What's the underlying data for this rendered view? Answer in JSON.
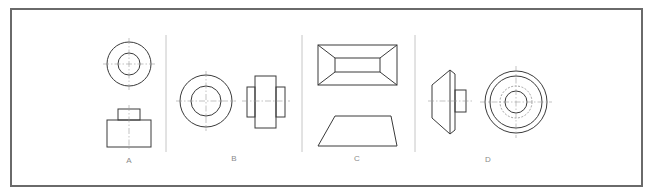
{
  "figure": {
    "panels": [
      {
        "id": "A",
        "label": "A",
        "description": "Top view (concentric circles) above front view (stepped block)"
      },
      {
        "id": "B",
        "label": "B",
        "description": "Front view (concentric circles) beside side view (hub with flanges)"
      },
      {
        "id": "C",
        "label": "C",
        "description": "Top view (frustum rectangle) above front view (trapezoid)"
      },
      {
        "id": "D",
        "label": "D",
        "description": "Side view (chamfered disc with boss) beside front view (concentric circles with hidden circle)"
      }
    ]
  },
  "colors": {
    "line": "#3a3a3a",
    "centerline": "#9a9a9a",
    "divider": "#b8b8b8",
    "border": "#6a6a6a",
    "label": "#8a8a8a"
  }
}
